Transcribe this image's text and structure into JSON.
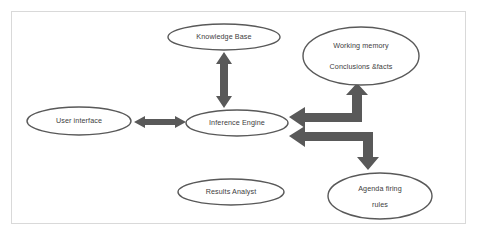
{
  "diagram": {
    "background_color": "#ffffff",
    "frame_color": "#d9d9d9",
    "shape_stroke_color": "#595959",
    "arrow_color": "#595959",
    "text_color": "#404040",
    "nodes": [
      {
        "id": "knowledge-base",
        "label": "Knowledge Base",
        "lines": [
          "Knowledge Base"
        ],
        "shape": "ellipse",
        "cx": 224,
        "cy": 37,
        "rx": 56,
        "ry": 13
      },
      {
        "id": "working-memory",
        "label": "Working memory Conclusions &facts",
        "lines": [
          "Working memory",
          "Conclusions &facts"
        ],
        "shape": "ellipse",
        "cx": 361,
        "cy": 56,
        "rx": 58,
        "ry": 29
      },
      {
        "id": "user-interface",
        "label": "User interface",
        "lines": [
          "User interface"
        ],
        "shape": "ellipse",
        "cx": 79,
        "cy": 121,
        "rx": 52,
        "ry": 14
      },
      {
        "id": "inference-engine",
        "label": "Inference Engine",
        "lines": [
          "Inference Engine"
        ],
        "shape": "ellipse",
        "cx": 237,
        "cy": 123,
        "rx": 51,
        "ry": 13
      },
      {
        "id": "results-analyst",
        "label": "Results Analyst",
        "lines": [
          "Results Analyst"
        ],
        "shape": "ellipse",
        "cx": 231,
        "cy": 192,
        "rx": 53,
        "ry": 13
      },
      {
        "id": "agenda-firing-rules",
        "label": "Agenda firing rules",
        "lines": [
          "Agenda firing",
          "rules"
        ],
        "shape": "ellipse",
        "cx": 380,
        "cy": 196,
        "rx": 52,
        "ry": 23
      }
    ],
    "connectors": [
      {
        "id": "kb-ie",
        "from": "knowledge-base",
        "to": "inference-engine",
        "style": "double-headed",
        "orientation": "vertical"
      },
      {
        "id": "ui-ie",
        "from": "user-interface",
        "to": "inference-engine",
        "style": "double-headed",
        "orientation": "horizontal"
      },
      {
        "id": "ie-wm",
        "from": "inference-engine",
        "to": "working-memory",
        "style": "elbow",
        "orientation": "left-then-up"
      },
      {
        "id": "ie-agenda",
        "from": "inference-engine",
        "to": "agenda-firing-rules",
        "style": "elbow",
        "orientation": "left-then-down"
      }
    ]
  }
}
